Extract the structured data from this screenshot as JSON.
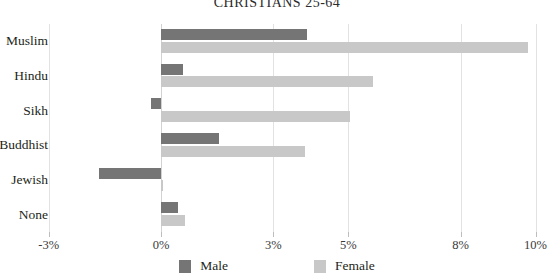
{
  "chart_data": {
    "type": "bar",
    "orientation": "horizontal",
    "title": "CHRISTIANS 25-64",
    "xlabel": "",
    "ylabel": "",
    "categories": [
      "Muslim",
      "Hindu",
      "Sikh",
      "Buddhist",
      "Jewish",
      "None"
    ],
    "series": [
      {
        "name": "Male",
        "color": "#757575",
        "values": [
          3.9,
          0.6,
          -0.28,
          1.55,
          -1.65,
          0.45
        ]
      },
      {
        "name": "Female",
        "color": "#c8c8c8",
        "values": [
          9.8,
          5.65,
          5.05,
          3.85,
          0.05,
          0.65
        ]
      }
    ],
    "xlim": [
      -3,
      10
    ],
    "xticks": [
      -3,
      0,
      3,
      5,
      8,
      10
    ],
    "xtick_labels": [
      "-3%",
      "0%",
      "3%",
      "5%",
      "8%",
      "10%"
    ],
    "grid": true,
    "legend_position": "bottom"
  },
  "legend": {
    "male_label": "Male",
    "female_label": "Female"
  }
}
